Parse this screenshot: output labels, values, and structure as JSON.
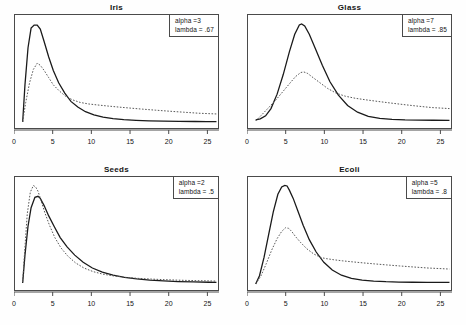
{
  "figure": {
    "background": "#fefefe",
    "frame_color": "#4a4a4a",
    "solid_color": "#1a1a1a",
    "dotted_color": "#555555",
    "rows": 2,
    "cols": 2
  },
  "axis": {
    "ticks": [
      0,
      5,
      10,
      15,
      20,
      25
    ],
    "tick_labels": [
      "0",
      "5",
      "10",
      "15",
      "20",
      "25"
    ],
    "xmin": 0,
    "xmax": 26.5
  },
  "panels": [
    {
      "id": "iris",
      "title": "Iris",
      "legend": {
        "alpha_label": "alpha =3",
        "lambda_label": "lambda = .67"
      }
    },
    {
      "id": "glass",
      "title": "Glass",
      "legend": {
        "alpha_label": "alpha =7",
        "lambda_label": "lambda = .85"
      }
    },
    {
      "id": "seeds",
      "title": "Seeds",
      "legend": {
        "alpha_label": "alpha =2",
        "lambda_label": "lambda = .5"
      }
    },
    {
      "id": "ecoli",
      "title": "Ecoli",
      "legend": {
        "alpha_label": "alpha =5",
        "lambda_label": "lambda = .8"
      }
    }
  ],
  "chart_data": {
    "type": "line",
    "title": "",
    "xlabel": "",
    "ylabel": "",
    "grid": false,
    "legend_position": "top-right-inside",
    "xlim": [
      0,
      26.5
    ],
    "ylim": [
      0,
      1
    ],
    "panels": [
      {
        "title": "Iris",
        "alpha": 3,
        "lambda": 0.67,
        "annotations": [
          "alpha =3",
          "lambda = .67"
        ],
        "series": [
          {
            "name": "solid",
            "style": "solid",
            "x": [
              1.0,
              1.3,
              1.7,
              2.1,
              2.5,
              2.9,
              3.3,
              3.8,
              4.4,
              5.0,
              5.7,
              6.5,
              7.3,
              8.2,
              9.2,
              10.3,
              11.5,
              12.8,
              14.2,
              15.8,
              17.5,
              19.4,
              21.4,
              23.5,
              25.0,
              26.3
            ],
            "y": [
              0.02,
              0.38,
              0.74,
              0.93,
              0.96,
              0.96,
              0.92,
              0.8,
              0.65,
              0.52,
              0.4,
              0.3,
              0.22,
              0.165,
              0.12,
              0.09,
              0.068,
              0.053,
              0.043,
              0.036,
              0.031,
              0.028,
              0.026,
              0.025,
              0.024,
              0.024
            ]
          },
          {
            "name": "dotted",
            "style": "dotted",
            "x": [
              1.0,
              1.4,
              1.9,
              2.4,
              2.9,
              3.3,
              3.8,
              4.4,
              5.0,
              5.8,
              6.6,
              7.5,
              8.5,
              9.6,
              10.8,
              12.1,
              13.5,
              15.0,
              16.6,
              18.3,
              20.1,
              22.0,
              24.0,
              26.3
            ],
            "y": [
              0.02,
              0.21,
              0.4,
              0.53,
              0.59,
              0.57,
              0.52,
              0.45,
              0.38,
              0.32,
              0.27,
              0.235,
              0.21,
              0.195,
              0.185,
              0.175,
              0.165,
              0.155,
              0.145,
              0.135,
              0.125,
              0.115,
              0.105,
              0.098
            ]
          }
        ]
      },
      {
        "title": "Glass",
        "alpha": 7,
        "lambda": 0.85,
        "annotations": [
          "alpha =7",
          "lambda = .85"
        ],
        "series": [
          {
            "name": "solid",
            "style": "solid",
            "x": [
              1.0,
              1.6,
              2.3,
              3.0,
              3.8,
              4.6,
              5.4,
              6.1,
              6.7,
              7.0,
              7.4,
              8.0,
              8.8,
              9.7,
              10.7,
              11.8,
              13.0,
              14.3,
              15.7,
              17.2,
              18.8,
              20.5,
              22.3,
              24.2,
              26.3
            ],
            "y": [
              0.04,
              0.05,
              0.08,
              0.15,
              0.29,
              0.48,
              0.7,
              0.87,
              0.96,
              0.97,
              0.95,
              0.87,
              0.73,
              0.57,
              0.41,
              0.28,
              0.18,
              0.115,
              0.075,
              0.055,
              0.045,
              0.04,
              0.038,
              0.037,
              0.036
            ]
          },
          {
            "name": "dotted",
            "style": "dotted",
            "x": [
              1.0,
              1.8,
              2.7,
              3.6,
              4.5,
              5.4,
              6.2,
              6.9,
              7.3,
              7.8,
              8.5,
              9.4,
              10.4,
              11.5,
              12.7,
              14.0,
              15.4,
              16.9,
              18.5,
              20.2,
              22.0,
              24.0,
              26.3
            ],
            "y": [
              0.03,
              0.09,
              0.16,
              0.23,
              0.31,
              0.39,
              0.46,
              0.5,
              0.505,
              0.49,
              0.45,
              0.4,
              0.345,
              0.3,
              0.27,
              0.25,
              0.235,
              0.22,
              0.205,
              0.19,
              0.175,
              0.16,
              0.15
            ]
          }
        ]
      },
      {
        "title": "Seeds",
        "alpha": 2,
        "lambda": 0.5,
        "annotations": [
          "alpha =2",
          "lambda = .5"
        ],
        "series": [
          {
            "name": "solid",
            "style": "solid",
            "x": [
              1.0,
              1.3,
              1.7,
              2.1,
              2.6,
              3.0,
              3.3,
              3.8,
              4.4,
              5.1,
              5.9,
              6.8,
              7.8,
              8.9,
              10.1,
              11.4,
              12.8,
              14.3,
              15.9,
              17.6,
              19.4,
              21.3,
              23.3,
              25.3,
              26.3
            ],
            "y": [
              0.03,
              0.3,
              0.58,
              0.76,
              0.86,
              0.87,
              0.85,
              0.78,
              0.68,
              0.58,
              0.47,
              0.38,
              0.3,
              0.23,
              0.175,
              0.135,
              0.105,
              0.085,
              0.07,
              0.058,
              0.05,
              0.044,
              0.04,
              0.037,
              0.036
            ]
          },
          {
            "name": "dotted",
            "style": "dotted",
            "x": [
              1.0,
              1.3,
              1.6,
              2.0,
              2.4,
              2.7,
              3.0,
              3.4,
              3.9,
              4.5,
              5.2,
              6.0,
              6.9,
              7.9,
              9.0,
              10.2,
              11.5,
              12.9,
              14.4,
              16.0,
              17.7,
              19.5,
              21.4,
              23.4,
              25.4,
              26.3
            ],
            "y": [
              0.04,
              0.38,
              0.7,
              0.91,
              0.975,
              0.96,
              0.92,
              0.83,
              0.71,
              0.59,
              0.47,
              0.37,
              0.29,
              0.225,
              0.175,
              0.14,
              0.115,
              0.098,
              0.085,
              0.075,
              0.068,
              0.062,
              0.057,
              0.053,
              0.05,
              0.048
            ]
          }
        ]
      },
      {
        "title": "Ecoli",
        "alpha": 5,
        "lambda": 0.8,
        "annotations": [
          "alpha =5",
          "lambda = .8"
        ],
        "series": [
          {
            "name": "solid",
            "style": "solid",
            "x": [
              1.0,
              1.5,
              2.1,
              2.7,
              3.3,
              3.9,
              4.4,
              4.8,
              5.1,
              5.4,
              5.9,
              6.5,
              7.2,
              8.0,
              8.9,
              9.9,
              11.0,
              12.2,
              13.5,
              14.9,
              16.4,
              18.0,
              19.7,
              21.5,
              23.4,
              26.3
            ],
            "y": [
              0.02,
              0.1,
              0.28,
              0.5,
              0.72,
              0.89,
              0.96,
              0.975,
              0.97,
              0.93,
              0.85,
              0.73,
              0.59,
              0.45,
              0.33,
              0.23,
              0.155,
              0.105,
              0.075,
              0.058,
              0.048,
              0.042,
              0.039,
              0.037,
              0.036,
              0.035
            ]
          },
          {
            "name": "dotted",
            "style": "dotted",
            "x": [
              1.0,
              1.7,
              2.4,
              3.1,
              3.8,
              4.4,
              4.9,
              5.3,
              5.7,
              6.2,
              6.9,
              7.7,
              8.6,
              9.6,
              10.3,
              11.2,
              12.3,
              13.6,
              15.0,
              16.5,
              18.1,
              19.8,
              21.6,
              23.5,
              26.3
            ],
            "y": [
              0.02,
              0.1,
              0.22,
              0.35,
              0.46,
              0.53,
              0.565,
              0.56,
              0.53,
              0.48,
              0.42,
              0.36,
              0.31,
              0.275,
              0.265,
              0.255,
              0.245,
              0.235,
              0.225,
              0.215,
              0.205,
              0.195,
              0.185,
              0.175,
              0.165
            ]
          }
        ]
      }
    ]
  }
}
